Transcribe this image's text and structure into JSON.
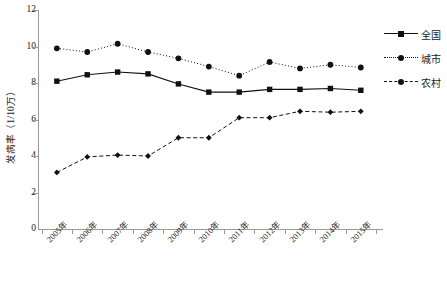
{
  "chart_data": {
    "type": "line",
    "title": "",
    "xlabel": "",
    "ylabel": "发病率（1/10万）",
    "ylim": [
      0,
      12
    ],
    "yticks": [
      0,
      2,
      4,
      6,
      8,
      10,
      12
    ],
    "grid": false,
    "legend_position": "right",
    "categories": [
      "2005年",
      "2006年",
      "2007年",
      "2008年",
      "2009年",
      "2010年",
      "2011年",
      "2012年",
      "2013年",
      "2014年",
      "2015年"
    ],
    "series": [
      {
        "name": "全国",
        "line_style": "solid",
        "marker": "square",
        "color": "#111111",
        "values": [
          8.1,
          8.45,
          8.6,
          8.5,
          7.95,
          7.5,
          7.5,
          7.65,
          7.65,
          7.7,
          7.6
        ]
      },
      {
        "name": "城市",
        "line_style": "dotted",
        "marker": "circle",
        "color": "#111111",
        "values": [
          9.9,
          9.7,
          10.15,
          9.7,
          9.35,
          8.9,
          8.4,
          9.15,
          8.8,
          9.0,
          8.85
        ]
      },
      {
        "name": "农村",
        "line_style": "dashed",
        "marker": "diamond",
        "color": "#111111",
        "values": [
          3.1,
          3.95,
          4.05,
          4.0,
          5.0,
          5.0,
          6.1,
          6.1,
          6.45,
          6.4,
          6.45
        ]
      }
    ]
  },
  "axes": {
    "y_title": "发病率（1/10万）",
    "y_tick_labels": [
      "0",
      "2",
      "4",
      "6",
      "8",
      "10",
      "12"
    ],
    "x_tick_labels": [
      "2005年",
      "2006年",
      "2007年",
      "2008年",
      "2009年",
      "2010年",
      "2011年",
      "2012年",
      "2013年",
      "2014年",
      "2015年"
    ]
  },
  "legend": {
    "items": [
      {
        "label": "全国"
      },
      {
        "label": "城市"
      },
      {
        "label": "农村"
      }
    ]
  }
}
